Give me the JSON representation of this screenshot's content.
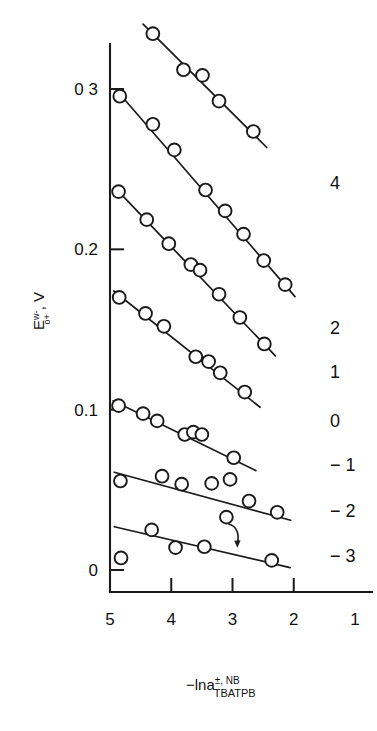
{
  "chart_data": {
    "type": "line",
    "title": "",
    "xlabel": "-lna(TBATPB, NB, +/-)",
    "xlabel_parts": {
      "main": "−lna",
      "superscript": "±, NB",
      "subscript": "TBATPB"
    },
    "ylabel": "E(o+, w-), V",
    "ylabel_parts": {
      "main": "E",
      "superscript": "w-",
      "subscript": "o+",
      "suffix": ", V"
    },
    "xlim": [
      5,
      1
    ],
    "ylim": [
      -0.02,
      0.345
    ],
    "x_ticks": [
      5,
      4,
      3,
      2,
      1
    ],
    "x_tick_labels": [
      "5",
      "4",
      "3",
      "2",
      "1"
    ],
    "y_ticks": [
      0.3,
      0.2,
      0.1,
      0
    ],
    "y_tick_labels": [
      "0 3",
      "0.2",
      "0.1",
      "0"
    ],
    "grid": false,
    "legend_position": "right-end-of-line",
    "x_axis_inverted": true,
    "marker": "open-circle",
    "series": [
      {
        "name": "4",
        "label": "4",
        "x": [
          4.3,
          3.8,
          3.49,
          3.22,
          2.66
        ],
        "y": [
          0.3345,
          0.312,
          0.3085,
          0.2925,
          0.2735
        ],
        "line_x": [
          4.46,
          2.44
        ],
        "line_y": [
          0.3405,
          0.2635
        ]
      },
      {
        "name": "2",
        "label": "2",
        "x": [
          4.84,
          4.3,
          3.95,
          3.44,
          3.12,
          2.82,
          2.49,
          2.14
        ],
        "y": [
          0.2955,
          0.278,
          0.262,
          0.237,
          0.224,
          0.2095,
          0.193,
          0.178
        ],
        "line_x": [
          4.9,
          1.98
        ],
        "line_y": [
          0.2995,
          0.1705
        ]
      },
      {
        "name": "1",
        "label": "1",
        "x": [
          4.86,
          4.4,
          4.04,
          3.68,
          3.53,
          3.22,
          2.88,
          2.48
        ],
        "y": [
          0.236,
          0.2185,
          0.2035,
          0.1905,
          0.187,
          0.172,
          0.1575,
          0.141
        ],
        "line_x": [
          4.92,
          2.3
        ],
        "line_y": [
          0.2385,
          0.1335
        ]
      },
      {
        "name": "0",
        "label": "0",
        "x": [
          4.85,
          4.42,
          4.12,
          3.6,
          3.39,
          3.2,
          2.8
        ],
        "y": [
          0.17,
          0.16,
          0.152,
          0.133,
          0.13,
          0.123,
          0.111
        ],
        "line_x": [
          4.94,
          2.55
        ],
        "line_y": [
          0.174,
          0.1015
        ]
      },
      {
        "name": "-1",
        "label": "− 1",
        "x": [
          4.86,
          4.46,
          4.23,
          3.78,
          3.64,
          3.5,
          2.98
        ],
        "y": [
          0.1025,
          0.0975,
          0.093,
          0.0845,
          0.086,
          0.0845,
          0.07
        ],
        "line_x": [
          4.95,
          2.62
        ],
        "line_y": [
          0.1055,
          0.062
        ]
      },
      {
        "name": "-2",
        "label": "− 2",
        "x": [
          4.83,
          4.15,
          3.83,
          3.34,
          3.04,
          2.73,
          2.27
        ],
        "y": [
          0.0555,
          0.0585,
          0.0535,
          0.054,
          0.0565,
          0.043,
          0.036
        ],
        "line_x": [
          4.93,
          2.05
        ],
        "line_y": [
          0.061,
          0.031
        ]
      },
      {
        "name": "-3",
        "label": "− 3",
        "x": [
          4.82,
          4.32,
          3.93,
          3.46,
          2.36
        ],
        "y": [
          0.0075,
          0.025,
          0.014,
          0.0145,
          0.006
        ],
        "line_x": [
          4.93,
          2.06
        ],
        "line_y": [
          0.027,
          0.0015
        ]
      }
    ],
    "annotations": [
      {
        "type": "outlier-marker-with-arrow",
        "marker_x": 3.1,
        "marker_y": 0.033,
        "arrow_to_x": 2.92,
        "arrow_to_y": 0.0145,
        "points_to_series": "-3"
      }
    ]
  }
}
